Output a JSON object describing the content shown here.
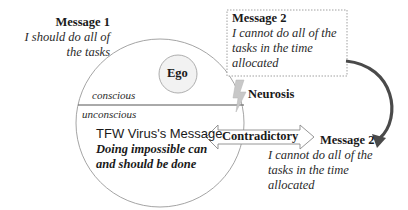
{
  "message1": {
    "title": "Message 1",
    "lines": [
      "I should do all of",
      "the tasks"
    ]
  },
  "message2_box": {
    "title": "Message 2",
    "lines": [
      "I cannot do all of the",
      "tasks in the time",
      "allocated"
    ]
  },
  "message2_lower": {
    "title": "Message 2",
    "lines": [
      "I cannot do all of the",
      "tasks in the time",
      "allocated"
    ]
  },
  "circle": {
    "ego_label": "Ego",
    "conscious_label": "conscious",
    "unconscious_label": "unconscious",
    "virus_title": "TFW Virus's Message",
    "virus_lines": [
      "Doing impossible can",
      "and should be done"
    ]
  },
  "neurosis_label": "Neurosis",
  "contradictory_label": "Contradictory",
  "icons": {
    "lightning": "lightning-bolt-icon",
    "double_arrow": "double-arrow-icon",
    "curved_arrow": "curved-arrow-icon"
  },
  "colors": {
    "line": "#9a9a9a",
    "ego_fill": "#f2f2f2",
    "bolt": "#c8c8c8",
    "curved_arrow": "#4a4a4a",
    "divider": "#555555"
  }
}
